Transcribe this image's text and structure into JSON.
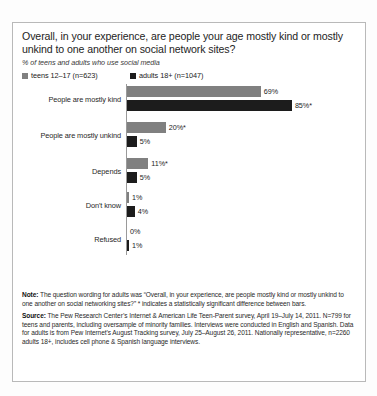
{
  "chart_data": {
    "type": "bar",
    "orientation": "horizontal",
    "title": "Overall, in your experience, are people your age mostly kind or mostly unkind to one another on social network sites?",
    "subtitle": "% of teens and adults who use social media",
    "xlabel": "",
    "ylabel": "",
    "xlim": [
      0,
      100
    ],
    "grid": false,
    "legend_position": "top-left",
    "categories": [
      "People are mostly kind",
      "People are mostly unkind",
      "Depends",
      "Don't know",
      "Refused"
    ],
    "series": [
      {
        "name": "teens 12–17 (n=623)",
        "color": "#808080",
        "values": [
          69,
          20,
          11,
          1,
          0
        ],
        "labels": [
          "69%",
          "20%*",
          "11%*",
          "1%",
          "0%"
        ]
      },
      {
        "name": "adults 18+ (n=1047)",
        "color": "#1c1c1c",
        "values": [
          85,
          5,
          5,
          4,
          1
        ],
        "labels": [
          "85%*",
          "5%",
          "5%",
          "4%",
          "1%"
        ]
      }
    ],
    "annotations": "* indicates a statistically significant difference between bars"
  },
  "legend": {
    "items": [
      {
        "label": "teens 12–17 (n=623)",
        "color": "#808080"
      },
      {
        "label": "adults 18+ (n=1047)",
        "color": "#1c1c1c"
      }
    ]
  },
  "footnotes": {
    "note_label": "Note:",
    "note_text": " The question wording for adults was “Overall, in your experience, are people mostly kind or mostly unkind to one another on social networking sites?” * indicates a statistically significant difference between bars.",
    "source_label": "Source:",
    "source_text": " The Pew Research Center’s Internet & American Life Teen-Parent survey, April 19–July 14, 2011. N=799 for teens and parents, including oversample of minority families. Interviews were conducted in English and Spanish. Data for adults is from Pew Internet’s August Tracking survey, July 25–August 26, 2011. Nationally representative, n=2260 adults 18+, includes cell phone & Spanish language interviews."
  }
}
